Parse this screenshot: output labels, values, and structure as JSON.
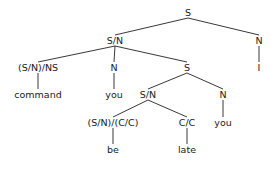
{
  "diagram": {
    "type": "parse-tree",
    "line_color": "#222222",
    "text_color": "#1a1a1a",
    "nodes": [
      {
        "id": "n0",
        "label": "S",
        "x": 188,
        "y": 12
      },
      {
        "id": "n1",
        "label": "S/N",
        "x": 115,
        "y": 40
      },
      {
        "id": "n2",
        "label": "N",
        "x": 259,
        "y": 40
      },
      {
        "id": "n3",
        "label": "(S/N)/NS",
        "x": 38,
        "y": 67
      },
      {
        "id": "n4",
        "label": "N",
        "x": 114,
        "y": 67
      },
      {
        "id": "n5",
        "label": "S",
        "x": 187,
        "y": 67
      },
      {
        "id": "n6",
        "label": "I",
        "x": 259,
        "y": 67
      },
      {
        "id": "n7",
        "label": "command",
        "x": 38,
        "y": 94
      },
      {
        "id": "n8",
        "label": "you",
        "x": 114,
        "y": 94
      },
      {
        "id": "n9",
        "label": "S/N",
        "x": 148,
        "y": 94
      },
      {
        "id": "n10",
        "label": "N",
        "x": 223,
        "y": 94
      },
      {
        "id": "n11",
        "label": "(S/N)/(C/C)",
        "x": 113,
        "y": 122
      },
      {
        "id": "n12",
        "label": "C/C",
        "x": 187,
        "y": 122
      },
      {
        "id": "n13",
        "label": "you",
        "x": 223,
        "y": 122
      },
      {
        "id": "n14",
        "label": "be",
        "x": 113,
        "y": 149
      },
      {
        "id": "n15",
        "label": "late",
        "x": 187,
        "y": 149
      }
    ],
    "edges": [
      [
        "n0",
        "n1"
      ],
      [
        "n0",
        "n2"
      ],
      [
        "n1",
        "n3"
      ],
      [
        "n1",
        "n4"
      ],
      [
        "n1",
        "n5"
      ],
      [
        "n2",
        "n6"
      ],
      [
        "n3",
        "n7"
      ],
      [
        "n4",
        "n8"
      ],
      [
        "n5",
        "n9"
      ],
      [
        "n5",
        "n10"
      ],
      [
        "n9",
        "n11"
      ],
      [
        "n9",
        "n12"
      ],
      [
        "n10",
        "n13"
      ],
      [
        "n11",
        "n14"
      ],
      [
        "n12",
        "n15"
      ]
    ]
  }
}
